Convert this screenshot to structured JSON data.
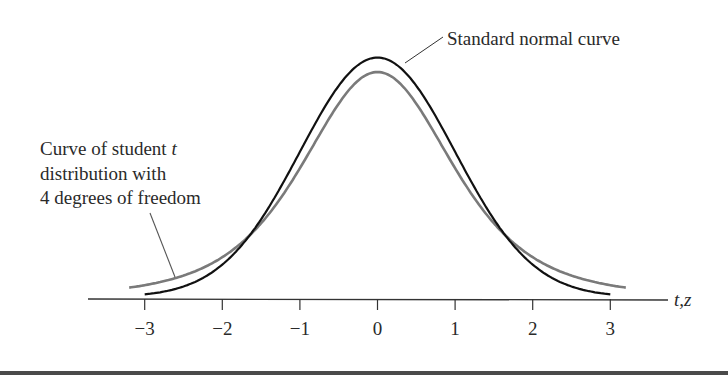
{
  "chart_data": {
    "type": "line",
    "title": "",
    "xlabel": "t,z",
    "ylabel": "",
    "xlim": [
      -3.4,
      3.9
    ],
    "x_ticks": [
      -3,
      -2,
      -1,
      0,
      1,
      2,
      3
    ],
    "x_tick_labels": [
      "−3",
      "−2",
      "−1",
      "0",
      "1",
      "2",
      "3"
    ],
    "grid": false,
    "legend": "annotations",
    "series": [
      {
        "name": "Standard normal curve",
        "color": "#111111",
        "x_range": [
          -3,
          3
        ],
        "distribution": "normal(0,1)",
        "peak_density": 0.399
      },
      {
        "name": "Curve of student t distribution with 4 degrees of freedom",
        "color": "#7a7a7a",
        "x_range": [
          -3.2,
          3.2
        ],
        "distribution": "student_t(df=4)",
        "peak_density": 0.375
      }
    ],
    "annotations": [
      {
        "target": "Standard normal curve",
        "lines": [
          "Standard normal curve"
        ]
      },
      {
        "target": "Curve of student t distribution with 4 degrees of freedom",
        "lines": [
          "Curve of student ",
          "t",
          "distribution with",
          "4 degrees of freedom"
        ]
      }
    ]
  },
  "labels": {
    "normal": "Standard normal curve",
    "t_line1_prefix": "Curve of student ",
    "t_line1_var": "t",
    "t_line2": "distribution with",
    "t_line3": "4 degrees of freedom",
    "axis": "t,z"
  },
  "ticks": [
    {
      "label": "−3"
    },
    {
      "label": "−2"
    },
    {
      "label": "−1"
    },
    {
      "label": "0"
    },
    {
      "label": "1"
    },
    {
      "label": "2"
    },
    {
      "label": "3"
    }
  ]
}
